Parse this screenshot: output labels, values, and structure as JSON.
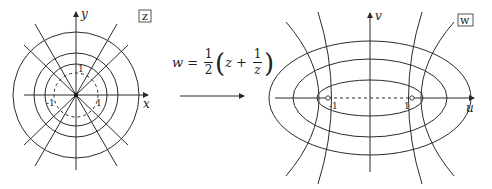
{
  "left_plane": {
    "label": "z",
    "x_axis": "x",
    "y_axis": "y",
    "ticks": {
      "top": "1",
      "left": "-1",
      "right": "1"
    },
    "circle_radii": [
      63,
      42,
      31
    ],
    "unit_circle_dashed": true,
    "radial_line_angles_deg": [
      0,
      30,
      60,
      90,
      120,
      150
    ]
  },
  "mapping": {
    "w": "w",
    "equals": "=",
    "half_num": "1",
    "half_den": "2",
    "z": "z",
    "plus": "+",
    "inv_num": "1",
    "inv_den": "z",
    "lparen": "(",
    "rparen": ")"
  },
  "right_plane": {
    "label": "w",
    "x_axis": "u",
    "y_axis": "v",
    "ticks": {
      "left": "-1",
      "right": "1"
    },
    "ellipses": [
      [
        101,
        57
      ],
      [
        77,
        39
      ],
      [
        53,
        18
      ]
    ],
    "focal_segment_dashed": true
  },
  "colors": {
    "ink": "#2b2b2b",
    "background": "#ffffff"
  }
}
